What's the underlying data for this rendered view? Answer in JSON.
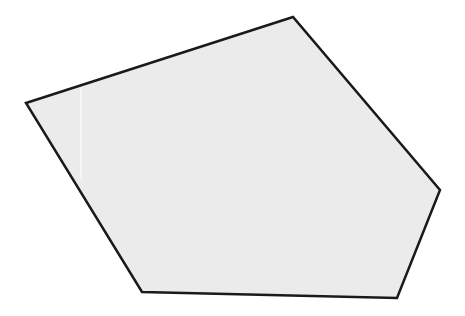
{
  "diagram": {
    "shape": "pentagon",
    "fill": "#ebebeb",
    "stroke": "#1a1a1a",
    "stroke_width": 2.5,
    "vertices": [
      [
        26,
        103
      ],
      [
        293,
        17
      ],
      [
        440,
        190
      ],
      [
        397,
        298
      ],
      [
        142,
        292
      ]
    ],
    "artifact_line": {
      "x": 81,
      "y1": 88,
      "y2": 180,
      "color": "#ffffff"
    }
  }
}
